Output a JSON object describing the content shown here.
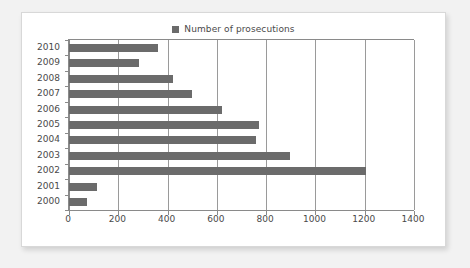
{
  "legend": {
    "marker_name": "legend-swatch-icon",
    "label": "Number of prosecutions",
    "color": "#6b6b6b"
  },
  "chart_data": {
    "type": "bar",
    "orientation": "horizontal",
    "title": "",
    "subtitle": "",
    "xlabel": "",
    "ylabel": "",
    "categories": [
      "2010",
      "2009",
      "2008",
      "2007",
      "2006",
      "2005",
      "2004",
      "2003",
      "2002",
      "2001",
      "2000"
    ],
    "values": [
      360,
      285,
      420,
      500,
      620,
      770,
      760,
      895,
      1205,
      115,
      75
    ],
    "series": [
      {
        "name": "Number of prosecutions",
        "color": "#6b6b6b",
        "values": [
          360,
          285,
          420,
          500,
          620,
          770,
          760,
          895,
          1205,
          115,
          75
        ]
      }
    ],
    "xlim": [
      0,
      1400
    ],
    "xticks": [
      0,
      200,
      400,
      600,
      800,
      1000,
      1200,
      1400
    ],
    "xtick_labels": [
      "0",
      "200",
      "400",
      "600",
      "800",
      "1000",
      "1200",
      "1400"
    ],
    "grid": "vertical",
    "legend_position": "top-center",
    "bar_color": "#6b6b6b",
    "background": "#ffffff"
  },
  "colors": {
    "page_background": "#f2f2f2",
    "card_background": "#ffffff",
    "card_border": "#d8d8d8",
    "axis": "#8a8a8a",
    "gridline": "#9a9a9a",
    "text": "#4a4a4a",
    "bar": "#6b6b6b"
  }
}
